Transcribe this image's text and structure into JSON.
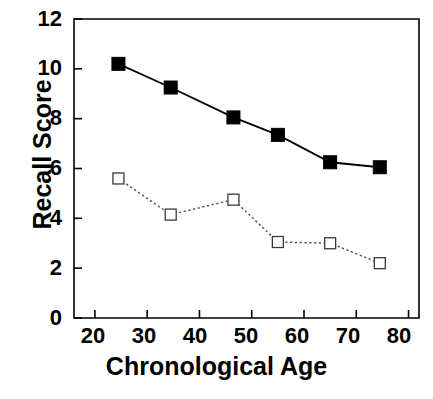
{
  "chart_data": {
    "type": "line",
    "title": "",
    "xlabel": "Chronological Age",
    "ylabel": "Recall Score",
    "xlim": [
      16,
      82
    ],
    "ylim": [
      0,
      12
    ],
    "xticks": [
      20,
      30,
      40,
      50,
      60,
      70,
      80
    ],
    "yticks": [
      0,
      2,
      4,
      6,
      8,
      10,
      12
    ],
    "grid": false,
    "legend": "none",
    "series": [
      {
        "name": "filled-squares-solid",
        "marker": "filled-square",
        "line_style": "solid",
        "color": "#000000",
        "x": [
          24.5,
          34.5,
          46.5,
          55.0,
          65.0,
          74.5
        ],
        "values": [
          10.2,
          9.25,
          8.05,
          7.35,
          6.25,
          6.05
        ]
      },
      {
        "name": "open-squares-dotted",
        "marker": "open-square",
        "line_style": "dotted",
        "color": "#555555",
        "x": [
          24.5,
          34.5,
          46.5,
          55.0,
          65.0,
          74.5
        ],
        "values": [
          5.6,
          4.15,
          4.75,
          3.05,
          3.0,
          2.2
        ]
      }
    ]
  },
  "axis": {
    "y_tick_labels": [
      "0",
      "2",
      "4",
      "6",
      "8",
      "10",
      "12"
    ],
    "x_tick_labels": [
      "20",
      "30",
      "40",
      "50",
      "60",
      "70",
      "80"
    ],
    "y_axis_title": "Recall Score",
    "x_axis_title": "Chronological Age"
  },
  "caption": {
    "text": ""
  }
}
